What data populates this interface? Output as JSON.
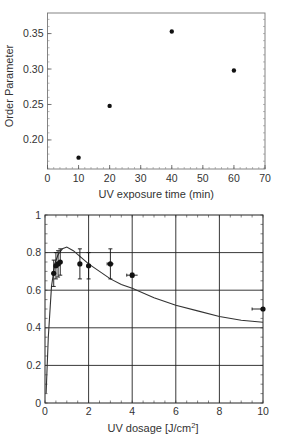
{
  "chart_data": [
    {
      "type": "scatter",
      "title": "",
      "xlabel": "UV exposure time (min)",
      "ylabel": "Order Parameter",
      "xlim": [
        0,
        70
      ],
      "ylim": [
        0.159,
        0.379
      ],
      "x_ticks": [
        "0",
        "10",
        "20",
        "30",
        "40",
        "50",
        "60",
        "70"
      ],
      "y_ticks": [
        "0.20",
        "0.25",
        "0.30",
        "0.35"
      ],
      "grid": false,
      "legend": null,
      "series": [
        {
          "name": "Order Parameter",
          "x": [
            10,
            20,
            40,
            60
          ],
          "y": [
            0.175,
            0.248,
            0.353,
            0.298
          ]
        }
      ]
    },
    {
      "type": "scatter",
      "title": "",
      "xlabel": "UV dosage [J/cm",
      "xlabel_sup": "2",
      "xlabel_end": "]",
      "ylabel": "",
      "xlim": [
        0,
        10
      ],
      "ylim": [
        0,
        1
      ],
      "x_ticks": [
        "0",
        "2",
        "4",
        "6",
        "8",
        "10"
      ],
      "y_ticks": [
        "0",
        "0.2",
        "0.4",
        "0.6",
        "0.8",
        "1"
      ],
      "grid": true,
      "legend": null,
      "series": [
        {
          "name": "measured",
          "type": "scatter",
          "x": [
            0.4,
            0.5,
            0.6,
            0.7,
            1.6,
            2.0,
            3.0,
            4.0,
            10.0
          ],
          "y": [
            0.69,
            0.73,
            0.74,
            0.75,
            0.74,
            0.73,
            0.74,
            0.68,
            0.5
          ],
          "y_err": [
            0.07,
            0.07,
            0.07,
            0.07,
            0.08,
            0.07,
            0.08,
            0.01,
            0.0
          ],
          "x_err": [
            0.0,
            0.0,
            0.0,
            0.0,
            0.0,
            0.0,
            0.15,
            0.25,
            0.5
          ]
        },
        {
          "name": "model fit",
          "type": "line",
          "x": [
            0.05,
            0.15,
            0.3,
            0.45,
            0.6,
            0.8,
            1.0,
            1.3,
            1.6,
            2.0,
            2.5,
            3.0,
            3.5,
            4.0,
            5.0,
            6.0,
            7.0,
            8.0,
            9.0,
            10.0
          ],
          "y": [
            0.05,
            0.35,
            0.62,
            0.74,
            0.79,
            0.82,
            0.83,
            0.81,
            0.78,
            0.74,
            0.7,
            0.66,
            0.63,
            0.61,
            0.56,
            0.52,
            0.49,
            0.46,
            0.44,
            0.43
          ]
        }
      ]
    }
  ]
}
